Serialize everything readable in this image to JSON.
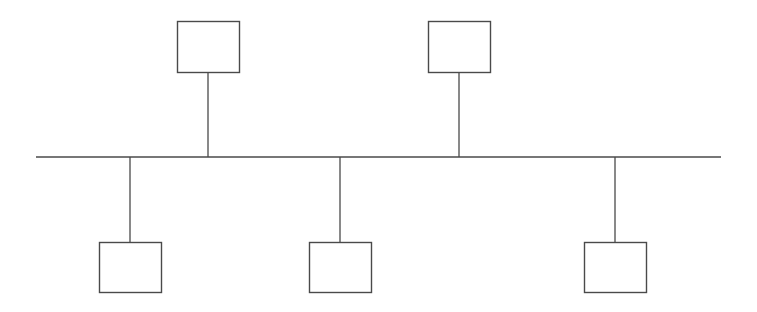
{
  "diagram": {
    "type": "bus-topology",
    "colors": {
      "stroke": "#4a4a4a",
      "fill": "#ffffff",
      "background": "#ffffff"
    },
    "bus": {
      "x1": 36,
      "x2": 721,
      "y": 157
    },
    "nodes": [
      {
        "id": "top-1",
        "position": "top",
        "x": 177,
        "y": 21,
        "w": 62,
        "h": 51,
        "label": ""
      },
      {
        "id": "top-2",
        "position": "top",
        "x": 428,
        "y": 21,
        "w": 62,
        "h": 51,
        "label": ""
      },
      {
        "id": "bottom-1",
        "position": "bottom",
        "x": 99,
        "y": 242,
        "w": 62,
        "h": 50,
        "label": ""
      },
      {
        "id": "bottom-2",
        "position": "bottom",
        "x": 309,
        "y": 242,
        "w": 62,
        "h": 50,
        "label": ""
      },
      {
        "id": "bottom-3",
        "position": "bottom",
        "x": 584,
        "y": 242,
        "w": 62,
        "h": 50,
        "label": ""
      }
    ]
  }
}
